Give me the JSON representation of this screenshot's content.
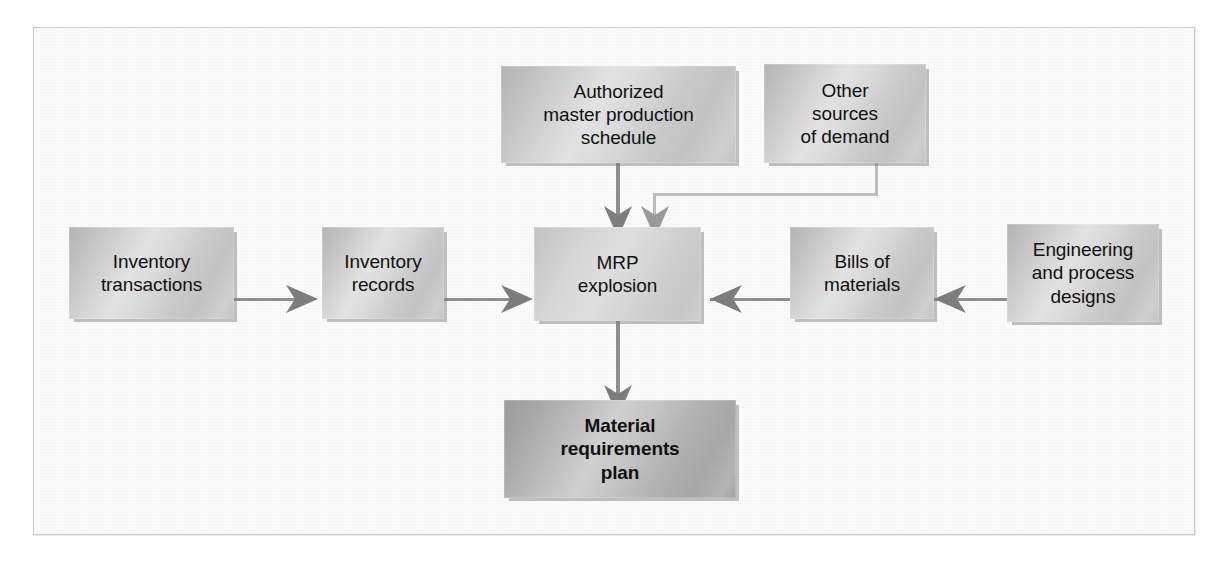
{
  "figure": {
    "type": "flow-diagram"
  },
  "nodes": [
    {
      "id": "authorized-mps",
      "lines": [
        "Authorized",
        "master production",
        "schedule"
      ],
      "style": "normal"
    },
    {
      "id": "other-sources-of-demand",
      "lines": [
        "Other",
        "sources",
        "of demand"
      ],
      "style": "normal"
    },
    {
      "id": "inventory-transactions",
      "lines": [
        "Inventory",
        "transactions"
      ],
      "style": "normal"
    },
    {
      "id": "inventory-records",
      "lines": [
        "Inventory",
        "records"
      ],
      "style": "normal"
    },
    {
      "id": "mrp-explosion",
      "lines": [
        "MRP",
        "explosion"
      ],
      "style": "center"
    },
    {
      "id": "bills-of-materials",
      "lines": [
        "Bills of",
        "materials"
      ],
      "style": "normal"
    },
    {
      "id": "engineering-and-process-designs",
      "lines": [
        "Engineering",
        "and process",
        "designs"
      ],
      "style": "normal"
    },
    {
      "id": "material-requirements-plan",
      "lines": [
        "Material",
        "requirements",
        "plan"
      ],
      "style": "dark"
    }
  ],
  "edges": [
    {
      "id": "inventory-transactions-to-inventory-records",
      "direction": "right"
    },
    {
      "id": "inventory-records-to-mrp-explosion",
      "direction": "right"
    },
    {
      "id": "authorized-mps-to-mrp-explosion",
      "direction": "down"
    },
    {
      "id": "other-sources-to-mrp-explosion",
      "direction": "down"
    },
    {
      "id": "bills-of-materials-to-mrp-explosion",
      "direction": "left"
    },
    {
      "id": "engineering-to-bills-of-materials",
      "direction": "left"
    },
    {
      "id": "mrp-explosion-to-material-requirements-plan",
      "direction": "down"
    }
  ],
  "colors": {
    "box_fill_light": "#dadada",
    "box_fill_dark": "#b4b4b4",
    "line": "#8e8e8e",
    "line_faint": "#bdbdbd",
    "text": "#111111",
    "panel_border": "#c9c9c9",
    "background": "#fbfbfb"
  }
}
